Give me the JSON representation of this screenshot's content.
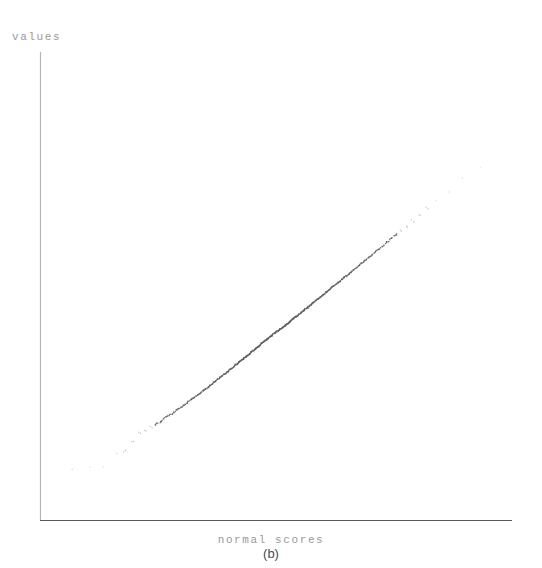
{
  "figure": {
    "caption": "(b)",
    "ylabel": "values",
    "xlabel": "normal scores"
  },
  "colors": {
    "background": "#ffffff",
    "axis_vertical": "#b4b4b4",
    "axis_horizontal": "#5a5a5a",
    "point_dense": "#5f5f5f",
    "point_sparse": "#c8c8c8",
    "label": "#9a9a9a",
    "caption": "#4a4a4a"
  },
  "chart_data": {
    "type": "scatter",
    "title": "(b)",
    "xlabel": "normal scores",
    "ylabel": "values",
    "grid": false,
    "legend": null,
    "axis_style": "L-shaped, no tick marks, no tick labels",
    "xlim": [
      -3.2,
      3.2
    ],
    "ylim": [
      -3.2,
      3.4
    ],
    "n_points": 300,
    "points": [
      [
        -3.05,
        -2.62
      ],
      [
        -2.78,
        -2.6
      ],
      [
        -2.58,
        -2.58
      ],
      [
        -2.4,
        -2.3
      ],
      [
        -2.26,
        -2.27
      ],
      [
        -2.14,
        -2.1
      ],
      [
        -2.04,
        -1.92
      ],
      [
        -1.95,
        -1.88
      ],
      [
        -1.87,
        -1.8
      ],
      [
        -1.79,
        -1.74
      ],
      [
        -1.72,
        -1.7
      ],
      [
        -1.66,
        -1.63
      ],
      [
        -1.6,
        -1.58
      ],
      [
        -1.54,
        -1.54
      ],
      [
        -1.49,
        -1.48
      ],
      [
        -1.44,
        -1.44
      ],
      [
        -1.39,
        -1.4
      ],
      [
        -1.34,
        -1.36
      ],
      [
        -1.3,
        -1.3
      ],
      [
        -1.26,
        -1.27
      ],
      [
        -1.22,
        -1.24
      ],
      [
        -1.18,
        -1.2
      ],
      [
        -1.14,
        -1.16
      ],
      [
        -1.1,
        -1.12
      ],
      [
        -1.07,
        -1.09
      ],
      [
        -1.03,
        -1.06
      ],
      [
        -1.0,
        -1.02
      ],
      [
        -0.97,
        -0.99
      ],
      [
        -0.94,
        -0.96
      ],
      [
        -0.91,
        -0.93
      ],
      [
        -0.88,
        -0.9
      ],
      [
        -0.85,
        -0.87
      ],
      [
        -0.82,
        -0.84
      ],
      [
        -0.79,
        -0.81
      ],
      [
        -0.76,
        -0.78
      ],
      [
        -0.74,
        -0.76
      ],
      [
        -0.71,
        -0.73
      ],
      [
        -0.68,
        -0.7
      ],
      [
        -0.66,
        -0.68
      ],
      [
        -0.63,
        -0.65
      ],
      [
        -0.61,
        -0.62
      ],
      [
        -0.58,
        -0.6
      ],
      [
        -0.56,
        -0.57
      ],
      [
        -0.54,
        -0.55
      ],
      [
        -0.51,
        -0.52
      ],
      [
        -0.49,
        -0.5
      ],
      [
        -0.47,
        -0.48
      ],
      [
        -0.44,
        -0.45
      ],
      [
        -0.42,
        -0.43
      ],
      [
        -0.4,
        -0.41
      ],
      [
        -0.38,
        -0.38
      ],
      [
        -0.36,
        -0.36
      ],
      [
        -0.33,
        -0.34
      ],
      [
        -0.31,
        -0.31
      ],
      [
        -0.29,
        -0.29
      ],
      [
        -0.27,
        -0.27
      ],
      [
        -0.25,
        -0.25
      ],
      [
        -0.23,
        -0.22
      ],
      [
        -0.21,
        -0.2
      ],
      [
        -0.19,
        -0.18
      ],
      [
        -0.17,
        -0.16
      ],
      [
        -0.15,
        -0.14
      ],
      [
        -0.13,
        -0.12
      ],
      [
        -0.11,
        -0.1
      ],
      [
        -0.09,
        -0.08
      ],
      [
        -0.07,
        -0.06
      ],
      [
        -0.05,
        -0.04
      ],
      [
        -0.03,
        -0.02
      ],
      [
        -0.01,
        0.0
      ],
      [
        0.01,
        0.02
      ],
      [
        0.03,
        0.04
      ],
      [
        0.05,
        0.06
      ],
      [
        0.07,
        0.07
      ],
      [
        0.09,
        0.09
      ],
      [
        0.11,
        0.11
      ],
      [
        0.13,
        0.13
      ],
      [
        0.15,
        0.15
      ],
      [
        0.17,
        0.17
      ],
      [
        0.19,
        0.19
      ],
      [
        0.21,
        0.21
      ],
      [
        0.23,
        0.24
      ],
      [
        0.25,
        0.26
      ],
      [
        0.27,
        0.28
      ],
      [
        0.29,
        0.3
      ],
      [
        0.31,
        0.32
      ],
      [
        0.33,
        0.34
      ],
      [
        0.36,
        0.37
      ],
      [
        0.38,
        0.39
      ],
      [
        0.4,
        0.41
      ],
      [
        0.42,
        0.43
      ],
      [
        0.44,
        0.46
      ],
      [
        0.47,
        0.48
      ],
      [
        0.49,
        0.5
      ],
      [
        0.51,
        0.53
      ],
      [
        0.54,
        0.55
      ],
      [
        0.56,
        0.58
      ],
      [
        0.58,
        0.6
      ],
      [
        0.61,
        0.63
      ],
      [
        0.63,
        0.65
      ],
      [
        0.66,
        0.68
      ],
      [
        0.68,
        0.7
      ],
      [
        0.71,
        0.73
      ],
      [
        0.74,
        0.76
      ],
      [
        0.76,
        0.79
      ],
      [
        0.79,
        0.82
      ],
      [
        0.82,
        0.85
      ],
      [
        0.85,
        0.88
      ],
      [
        0.88,
        0.91
      ],
      [
        0.91,
        0.94
      ],
      [
        0.94,
        0.97
      ],
      [
        0.97,
        1.0
      ],
      [
        1.0,
        1.04
      ],
      [
        1.03,
        1.07
      ],
      [
        1.07,
        1.1
      ],
      [
        1.1,
        1.14
      ],
      [
        1.14,
        1.18
      ],
      [
        1.18,
        1.22
      ],
      [
        1.22,
        1.26
      ],
      [
        1.26,
        1.3
      ],
      [
        1.3,
        1.35
      ],
      [
        1.34,
        1.39
      ],
      [
        1.39,
        1.44
      ],
      [
        1.44,
        1.49
      ],
      [
        1.49,
        1.55
      ],
      [
        1.54,
        1.6
      ],
      [
        1.6,
        1.66
      ],
      [
        1.66,
        1.73
      ],
      [
        1.72,
        1.8
      ],
      [
        1.79,
        1.87
      ],
      [
        1.87,
        1.95
      ],
      [
        1.95,
        2.04
      ],
      [
        2.04,
        2.14
      ],
      [
        2.14,
        2.25
      ],
      [
        2.26,
        2.38
      ],
      [
        2.4,
        2.52
      ],
      [
        2.58,
        2.68
      ],
      [
        2.78,
        2.95
      ],
      [
        3.05,
        3.18
      ]
    ],
    "tail_notes": {
      "lower_tail": "sparse faint points, roughly x in [-3.1, -2.0]",
      "upper_tail": "sparse faint points, roughly x in [2.0, 3.1], slight upward curl",
      "core": "dense dark band, roughly x in [-1.8, 1.8]"
    }
  }
}
